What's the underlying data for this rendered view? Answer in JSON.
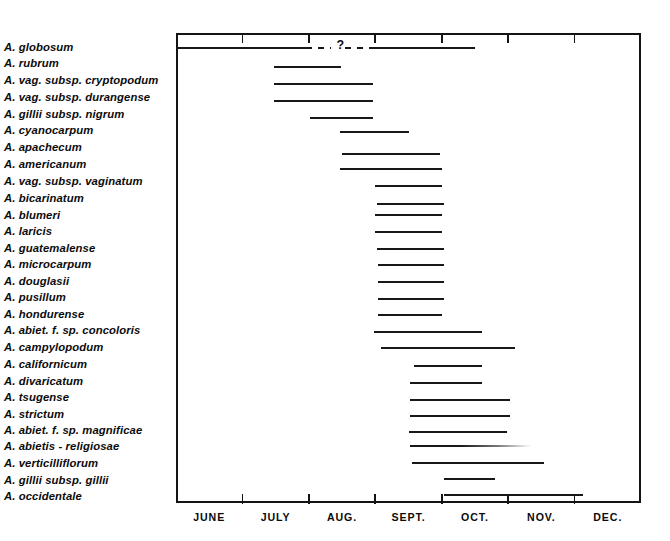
{
  "chart_data": {
    "type": "bar",
    "title": "",
    "subtitle": "",
    "xlabel": "",
    "ylabel": "",
    "orientation": "horizontal",
    "axis": {
      "months": [
        "JUNE",
        "JULY",
        "AUG.",
        "SEPT.",
        "OCT.",
        "NOV.",
        "DEC."
      ],
      "tick_months": [
        "JULY",
        "AUG.",
        "SEPT.",
        "OCT.",
        "NOV.",
        "DEC."
      ],
      "range_start": "JUNE 1",
      "range_end": "DEC. 31",
      "grid": false,
      "legend": "none"
    },
    "annotations": [
      {
        "text": "?",
        "on_category": "A. globosum",
        "meaning": "uncertain dispersal period shown as dashed line"
      }
    ],
    "categories": [
      "A. globosum",
      "A. rubrum",
      "A. vag. subsp. cryptopodum",
      "A. vag. subsp. durangense",
      "A. gillii subsp. nigrum",
      "A. cyanocarpum",
      "A. apachecum",
      "A. americanum",
      "A. vag. subsp. vaginatum",
      "A. bicarinatum",
      "A. blumeri",
      "A. laricis",
      "A. guatemalense",
      "A. microcarpum",
      "A. douglasii",
      "A. pusillum",
      "A. hondurense",
      "A. abiet. f. sp. concoloris",
      "A. campylopodum",
      "A. californicum",
      "A. divaricatum",
      "A. tsugense",
      "A. strictum",
      "A. abiet. f. sp. magnificae",
      "A. abietis - religiosae",
      "A. verticilliflorum",
      "A. gillii subsp. gillii",
      "A. occidentale"
    ],
    "bars": [
      {
        "label": "A. globosum",
        "start_month": 6.0,
        "end_month": 10.5,
        "style": "split-dashed",
        "solid_1": [
          6.0,
          7.95
        ],
        "dashed": [
          7.95,
          9.0
        ],
        "solid_2": [
          9.0,
          10.5
        ],
        "note": "?"
      },
      {
        "label": "A. rubrum",
        "start_month": 7.47,
        "end_month": 8.49,
        "style": "solid"
      },
      {
        "label": "A. vag. subsp. cryptopodum",
        "start_month": 7.47,
        "end_month": 8.96,
        "style": "solid"
      },
      {
        "label": "A. vag. subsp. durangense",
        "start_month": 7.47,
        "end_month": 8.96,
        "style": "solid"
      },
      {
        "label": "A. gillii subsp. nigrum",
        "start_month": 8.01,
        "end_month": 8.96,
        "style": "solid"
      },
      {
        "label": "A. cyanocarpum",
        "start_month": 8.47,
        "end_month": 9.51,
        "style": "solid"
      },
      {
        "label": "A. apachecum",
        "start_month": 8.5,
        "end_month": 9.98,
        "style": "solid"
      },
      {
        "label": "A. americanum",
        "start_month": 8.47,
        "end_month": 10.0,
        "style": "solid"
      },
      {
        "label": "A. vag. subsp. vaginatum",
        "start_month": 9.0,
        "end_month": 10.01,
        "style": "solid"
      },
      {
        "label": "A. bicarinatum",
        "start_month": 9.02,
        "end_month": 10.04,
        "style": "solid"
      },
      {
        "label": "A. blumeri",
        "start_month": 9.0,
        "end_month": 10.01,
        "style": "solid"
      },
      {
        "label": "A. laricis",
        "start_month": 9.0,
        "end_month": 10.01,
        "style": "solid"
      },
      {
        "label": "A. guatemalense",
        "start_month": 9.02,
        "end_month": 10.04,
        "style": "solid"
      },
      {
        "label": "A. microcarpum",
        "start_month": 9.04,
        "end_month": 10.04,
        "style": "solid"
      },
      {
        "label": "A. douglasii",
        "start_month": 9.04,
        "end_month": 10.04,
        "style": "solid"
      },
      {
        "label": "A. pusillum",
        "start_month": 9.04,
        "end_month": 10.04,
        "style": "solid"
      },
      {
        "label": "A. hondurense",
        "start_month": 9.04,
        "end_month": 10.01,
        "style": "solid"
      },
      {
        "label": "A. abiet. f. sp. concoloris",
        "start_month": 8.98,
        "end_month": 10.6,
        "style": "solid"
      },
      {
        "label": "A. campylopodum",
        "start_month": 9.08,
        "end_month": 11.11,
        "style": "solid"
      },
      {
        "label": "A. californicum",
        "start_month": 9.58,
        "end_month": 10.6,
        "style": "solid"
      },
      {
        "label": "A. divaricatum",
        "start_month": 9.53,
        "end_month": 10.6,
        "style": "solid"
      },
      {
        "label": "A. tsugense",
        "start_month": 9.53,
        "end_month": 11.03,
        "style": "solid"
      },
      {
        "label": "A. strictum",
        "start_month": 9.53,
        "end_month": 11.03,
        "style": "solid"
      },
      {
        "label": "A. abiet. f. sp. magnificae",
        "start_month": 9.5,
        "end_month": 10.98,
        "style": "solid"
      },
      {
        "label": "A. abietis - religiosae",
        "start_month": 9.53,
        "end_month": 11.35,
        "style": "fade"
      },
      {
        "label": "A. verticilliflorum",
        "start_month": 9.55,
        "end_month": 11.54,
        "style": "solid"
      },
      {
        "label": "A. gillii subsp. gillii",
        "start_month": 10.03,
        "end_month": 10.8,
        "style": "solid"
      },
      {
        "label": "A. occidentale",
        "start_month": 10.03,
        "end_month": 12.12,
        "style": "solid"
      }
    ]
  },
  "colors": {
    "bar": "#181818",
    "frame": "#141414",
    "background": "#ffffff",
    "text": "#0b0b0b"
  }
}
